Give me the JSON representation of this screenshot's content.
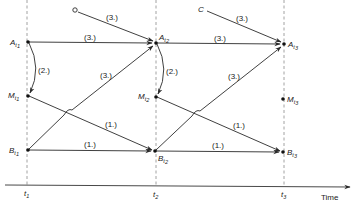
{
  "diagram": {
    "type": "time-unrolled state transition diagram",
    "axis": {
      "label": "Time",
      "ticks": [
        {
          "id": "t1",
          "base": "t",
          "sub": "1",
          "x": 27
        },
        {
          "id": "t2",
          "base": "t",
          "sub": "2",
          "x": 156
        },
        {
          "id": "t3",
          "base": "t",
          "sub": "3",
          "x": 284
        }
      ]
    },
    "nodes": [
      {
        "id": "A_t1",
        "base": "A",
        "sub": "t",
        "subsub": "1",
        "x": 28,
        "y": 42
      },
      {
        "id": "M_t1",
        "base": "M",
        "sub": "t",
        "subsub": "1",
        "x": 28,
        "y": 96
      },
      {
        "id": "B_t1",
        "base": "B",
        "sub": "t",
        "subsub": "1",
        "x": 28,
        "y": 150
      },
      {
        "id": "A_t2",
        "base": "A",
        "sub": "t",
        "subsub": "2",
        "x": 156,
        "y": 43
      },
      {
        "id": "M_t2",
        "base": "M",
        "sub": "t",
        "subsub": "2",
        "x": 156,
        "y": 97
      },
      {
        "id": "B_t2",
        "base": "B",
        "sub": "t",
        "subsub": "2",
        "x": 155,
        "y": 151
      },
      {
        "id": "A_t3",
        "base": "A",
        "sub": "t",
        "subsub": "3",
        "x": 284,
        "y": 44
      },
      {
        "id": "M_t3",
        "base": "M",
        "sub": "t",
        "subsub": "3",
        "x": 283,
        "y": 99
      },
      {
        "id": "B_t3",
        "base": "B",
        "sub": "t",
        "subsub": "3",
        "x": 283,
        "y": 152
      }
    ],
    "sources": [
      {
        "id": "open-circle",
        "label": "",
        "x": 75,
        "y": 10
      },
      {
        "id": "C",
        "label": "C",
        "x": 202,
        "y": 9
      }
    ],
    "edges": [
      {
        "from": "open-circle",
        "to": "A_t2",
        "label": "(3.)"
      },
      {
        "from": "C",
        "to": "A_t3",
        "label": "(3.)"
      },
      {
        "from": "A_t1",
        "to": "A_t2",
        "label": "(3.)"
      },
      {
        "from": "A_t2",
        "to": "A_t3",
        "label": "(3.)"
      },
      {
        "from": "A_t1",
        "to": "M_t1",
        "label": "(2.)",
        "curved": true
      },
      {
        "from": "A_t2",
        "to": "M_t2",
        "label": "(2.)",
        "curved": true
      },
      {
        "from": "B_t1",
        "to": "A_t2",
        "label": "(3.)"
      },
      {
        "from": "B_t2",
        "to": "A_t3",
        "label": "(3.)"
      },
      {
        "from": "M_t1",
        "to": "B_t2",
        "label": "(1.)"
      },
      {
        "from": "M_t2",
        "to": "B_t3",
        "label": "(1.)"
      },
      {
        "from": "B_t1",
        "to": "B_t2",
        "label": "(1.)"
      },
      {
        "from": "B_t2",
        "to": "B_t3",
        "label": "(1.)"
      }
    ],
    "labels": {
      "step1": "(1.)",
      "step2": "(2.)",
      "step3": "(3.)",
      "source_c": "C",
      "time": "Time",
      "t": "t",
      "one": "1",
      "two": "2",
      "three": "3",
      "A": "A",
      "M": "M",
      "B": "B"
    }
  }
}
